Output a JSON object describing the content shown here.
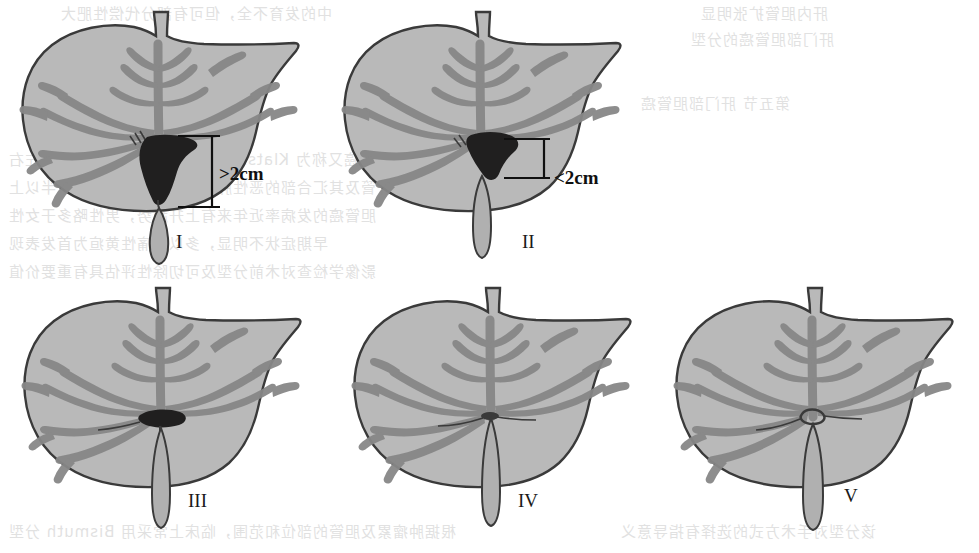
{
  "figure": {
    "panel_count": 5
  },
  "panels": [
    {
      "id": "panel-1",
      "label": "I",
      "measurement": ">2cm",
      "tumor": "large hilar mass extending below confluence",
      "has_tumor": true,
      "has_measurement": true
    },
    {
      "id": "panel-2",
      "label": "II",
      "measurement": "<2cm",
      "tumor": "hilar mass at confluence",
      "has_tumor": true,
      "has_measurement": true
    },
    {
      "id": "panel-3",
      "label": "III",
      "measurement": "",
      "tumor": "small flat lesion confined to confluence",
      "has_tumor": true,
      "has_measurement": false
    },
    {
      "id": "panel-4",
      "label": "IV",
      "measurement": "",
      "tumor": "no visible mass",
      "has_tumor": false,
      "has_measurement": false
    },
    {
      "id": "panel-5",
      "label": "V",
      "measurement": "",
      "tumor": "patent open confluence",
      "has_tumor": false,
      "has_measurement": false
    }
  ],
  "colors": {
    "liver_fill": "#b9b9b9",
    "liver_outline": "#3a3a3a",
    "vessel": "#878787",
    "vessel_dark": "#6f6f6f",
    "tumor": "#201f1f",
    "gallbladder_fill": "#b0b0b0",
    "annotation": "#101010",
    "background": "#ffffff"
  },
  "bleed_through": [
    {
      "text": "中的发育不全，但可有部分代偿性肥大",
      "x": 60,
      "y": 2,
      "size": 15
    },
    {
      "text": "肝内胆管扩张明显",
      "x": 700,
      "y": 2,
      "size": 15
    },
    {
      "text": "肝门部胆管癌的分型",
      "x": 690,
      "y": 28,
      "size": 15
    },
    {
      "text": "第五节 肝门部胆管癌",
      "x": 640,
      "y": 92,
      "size": 15
    },
    {
      "text": "肝门部胆管癌又称为 Klatskin 瘤，是指原发于肝总管、左右",
      "x": 8,
      "y": 148,
      "size": 15
    },
    {
      "text": "肝管及其汇合部的恶性肿瘤，占肝外胆管癌的一半以上",
      "x": 8,
      "y": 176,
      "size": 15
    },
    {
      "text": "胆管癌的发病率近年来有上升趋势，男性略多于女性",
      "x": 8,
      "y": 204,
      "size": 15
    },
    {
      "text": "早期症状不明显，多以无痛性黄疸为首发表现",
      "x": 8,
      "y": 232,
      "size": 15
    },
    {
      "text": "影像学检查对术前分型及可切除性评估具有重要价值",
      "x": 8,
      "y": 260,
      "size": 15
    },
    {
      "text": "一、病理分型",
      "x": 700,
      "y": 400,
      "size": 15
    },
    {
      "text": "根据肿瘤累及胆管的部位和范围，临床上常采用 Bismuth 分型",
      "x": 8,
      "y": 520,
      "size": 15
    },
    {
      "text": "该分型对手术方式的选择有指导意义",
      "x": 620,
      "y": 520,
      "size": 15
    }
  ]
}
